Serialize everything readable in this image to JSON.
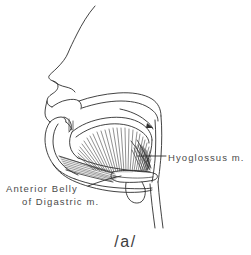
{
  "figure": {
    "kind": "midsagittal-vocal-tract-diagram",
    "background_color": "#ffffff",
    "ink_color": "#2e2e2e",
    "label_color": "#4a4a4a",
    "caption": "/a/",
    "labels": {
      "hyoglossus": "Hyoglossus m.",
      "digastric_line1": "Anterior Belly",
      "digastric_line2": "of Digastric m."
    },
    "structures": [
      "facial-profile",
      "nose",
      "upper-lip",
      "lower-lip",
      "hard-palate",
      "soft-palate",
      "tongue-body",
      "hyoglossus-muscle-fibers",
      "anterior-belly-digastric-fibers",
      "mandible",
      "incisor-teeth",
      "hyoid-bone",
      "pharyngeal-wall",
      "epiglottis",
      "neck-contour"
    ]
  }
}
